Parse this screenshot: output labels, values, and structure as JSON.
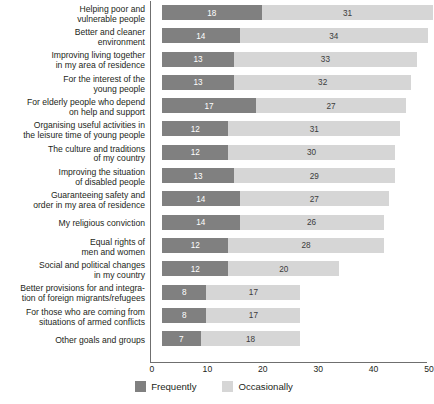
{
  "chart_data": {
    "type": "bar",
    "subtype": "stacked-horizontal",
    "title": "",
    "xlabel": "",
    "ylabel": "",
    "xlim": [
      0,
      50
    ],
    "xticks": [
      0,
      10,
      20,
      30,
      40,
      50
    ],
    "grid": false,
    "legend_position": "bottom-center",
    "categories": [
      "Helping poor and\nvulnerable people",
      "Better and cleaner\nenvironment",
      "Improving living together\nin my area of residence",
      "For the interest of the\nyoung people",
      "For elderly people who depend\non help and support",
      "Organising useful activities in\nthe leisure time of young people",
      "The culture and traditions\nof my country",
      "Improving the situation\nof disabled people",
      "Guaranteeing safety and\norder in my area of residence",
      "My religious conviction",
      "Equal rights of\nmen and women",
      "Social and political changes\nin my country",
      "Better provisions for and integra-\ntion of foreign migrants/refugees",
      "For those who are coming from\nsituations of armed conflicts",
      "Other goals and groups"
    ],
    "series": [
      {
        "name": "Frequently",
        "color": "#808080",
        "values": [
          18,
          14,
          13,
          13,
          17,
          12,
          12,
          13,
          14,
          14,
          12,
          12,
          8,
          8,
          7
        ]
      },
      {
        "name": "Occasionally",
        "color": "#d6d6d6",
        "values": [
          31,
          34,
          33,
          32,
          27,
          31,
          30,
          29,
          27,
          26,
          28,
          20,
          17,
          17,
          18
        ]
      }
    ]
  },
  "legend": {
    "items": [
      {
        "label": "Frequently",
        "color": "#808080"
      },
      {
        "label": "Occasionally",
        "color": "#d6d6d6"
      }
    ]
  },
  "axis": {
    "tick_labels": [
      "0",
      "10",
      "20",
      "30",
      "40",
      "50"
    ]
  }
}
